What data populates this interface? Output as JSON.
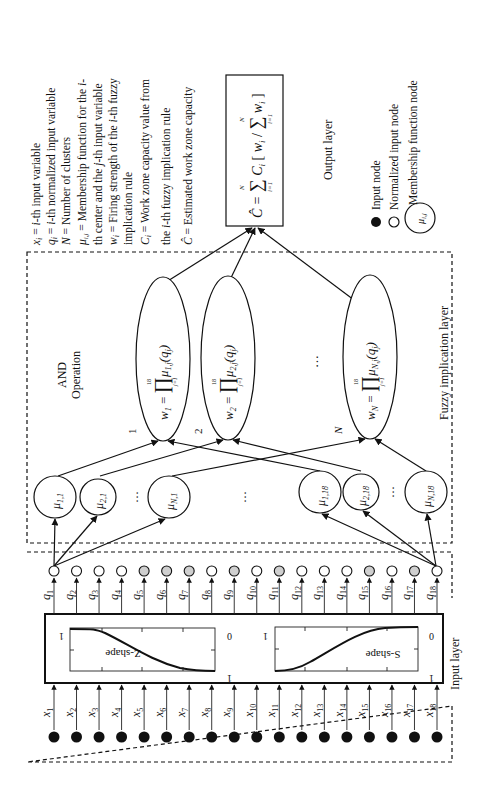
{
  "figure": {
    "orientation": "rotated 90deg counter-clockwise",
    "layers": {
      "input": "Input layer",
      "fuzzy": "Fuzzy implication layer",
      "output": "Output layer"
    },
    "and_operation": [
      "AND",
      "Operation"
    ],
    "legend_definitions": [
      "x_i = i-th input variable",
      "q_i = i-th normalized input variable",
      "N = Number of clusters",
      "μ_i,j = Membership function for the i-",
      "th center and the j-th input variable",
      "w_i = Firing strength of the i-th fuzzy",
      "implication rule",
      "C_i = Work zone capacity value from",
      "the i-th fuzzy implication rule",
      "Ĉ = Estimated work zone capacity"
    ],
    "node_legend": {
      "input_node": "Input node",
      "normalized_input_node": "Normalized input node",
      "membership_function_node": "Membership function node",
      "membership_symbol": "μi,j"
    },
    "output_formula": "Ĉ = Σ(i=1..N) C_i [ w_i / Σ(i=1..N) w_i ]",
    "rule_nodes": [
      {
        "label": "1",
        "formula": "w1 = ∏(j=1..18) μ1,j(qj)"
      },
      {
        "label": "2",
        "formula": "w2 = ∏(j=1..18) μ2,j(qj)"
      },
      {
        "label": "N",
        "formula": "wN = ∏(j=1..18) μN,j(qj)"
      }
    ],
    "membership_nodes": [
      "μ1,1",
      "μ2,1",
      "μN,1",
      "μ1,18",
      "μ2,18",
      "μN,18"
    ],
    "ellipsis": "…",
    "inputs": [
      "x1",
      "x2",
      "x3",
      "x4",
      "x5",
      "x6",
      "x7",
      "x8",
      "x9",
      "x10",
      "x11",
      "x12",
      "x13",
      "x14",
      "x15",
      "x16",
      "x17",
      "x18"
    ],
    "normalized_inputs": [
      "q1",
      "q2",
      "q3",
      "q4",
      "q5",
      "q6",
      "q7",
      "q8",
      "q9",
      "q10",
      "q11",
      "q12",
      "q13",
      "q14",
      "q15",
      "q16",
      "q17",
      "q18"
    ],
    "shaded_q_nodes": [
      5,
      6,
      7,
      9,
      11,
      15,
      17
    ],
    "normalization_curves": [
      {
        "name": "Z-shape",
        "left_tick": "1",
        "right_top": "0",
        "right_bottom": "1"
      },
      {
        "name": "S-shape",
        "left_tick": "1",
        "right_top": "0",
        "right_bottom": "1"
      }
    ]
  }
}
